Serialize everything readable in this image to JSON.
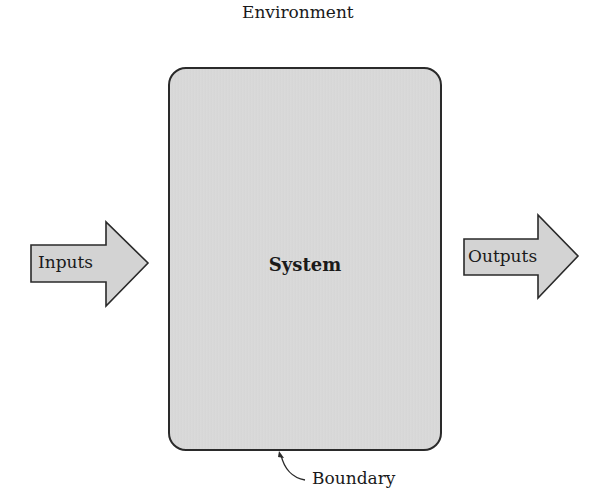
{
  "diagram": {
    "environment_label": "Environment",
    "system_label": "System",
    "boundary_label": "Boundary",
    "inputs_label": "Inputs",
    "outputs_label": "Outputs"
  },
  "colors": {
    "box_fill": "#d8d8d8",
    "arrow_fill": "#d3d3d3",
    "stroke": "#2a2a2a",
    "text": "#1a1a1a"
  }
}
